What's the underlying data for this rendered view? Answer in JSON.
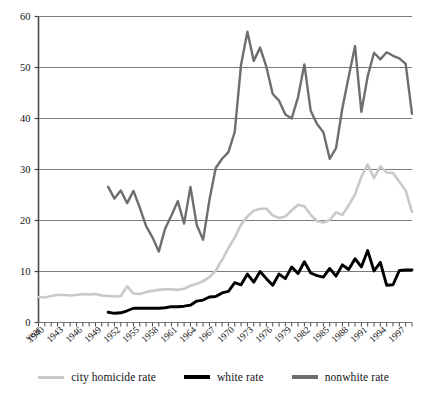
{
  "chart_data": {
    "type": "line",
    "title": "",
    "subtitle": "",
    "xlabel": "year",
    "ylabel": "",
    "ylim": [
      0,
      60
    ],
    "yticks": [
      0,
      10,
      20,
      30,
      40,
      50,
      60
    ],
    "grid": true,
    "legend_position": "bottom",
    "x_axis_first_label": "year",
    "xticks": [
      "1940",
      "1943",
      "1946",
      "1949",
      "1952",
      "1955",
      "1958",
      "1961",
      "1964",
      "1967",
      "1970",
      "1973",
      "1976",
      "1979",
      "1982",
      "1985",
      "1988",
      "1991",
      "1994",
      "1997"
    ],
    "x": [
      1939,
      1940,
      1941,
      1942,
      1943,
      1944,
      1945,
      1946,
      1947,
      1948,
      1949,
      1950,
      1951,
      1952,
      1953,
      1954,
      1955,
      1956,
      1957,
      1958,
      1959,
      1960,
      1961,
      1962,
      1963,
      1964,
      1965,
      1966,
      1967,
      1968,
      1969,
      1970,
      1971,
      1972,
      1973,
      1974,
      1975,
      1976,
      1977,
      1978,
      1979,
      1980,
      1981,
      1982,
      1983,
      1984,
      1985,
      1986,
      1987,
      1988,
      1989,
      1990,
      1991,
      1992,
      1993,
      1994,
      1995,
      1996,
      1997,
      1998
    ],
    "series": [
      {
        "name": "city homicide rate",
        "color": "#c9c9c9",
        "values": [
          5.0,
          4.9,
          5.2,
          5.4,
          5.4,
          5.3,
          5.4,
          5.6,
          5.5,
          5.6,
          5.3,
          5.2,
          5.1,
          5.2,
          7.1,
          5.7,
          5.6,
          6.0,
          6.2,
          6.4,
          6.5,
          6.5,
          6.4,
          6.6,
          7.2,
          7.6,
          8.1,
          8.9,
          10.2,
          12.3,
          14.6,
          16.7,
          19.2,
          20.8,
          21.9,
          22.3,
          22.3,
          21.0,
          20.5,
          20.8,
          22.0,
          23.1,
          22.8,
          21.1,
          19.9,
          19.6,
          20.1,
          21.6,
          21.1,
          23.0,
          25.1,
          28.6,
          31.0,
          28.3,
          30.6,
          29.4,
          29.3,
          27.6,
          25.9,
          21.7
        ]
      },
      {
        "name": "white rate",
        "color": "#000000",
        "values": [
          null,
          null,
          null,
          null,
          null,
          null,
          null,
          null,
          null,
          null,
          null,
          2.0,
          1.8,
          1.9,
          2.3,
          2.8,
          2.8,
          2.8,
          2.8,
          2.8,
          2.9,
          3.1,
          3.1,
          3.2,
          3.4,
          4.2,
          4.4,
          5.0,
          5.1,
          5.8,
          6.1,
          7.8,
          7.4,
          9.5,
          7.9,
          10.0,
          8.6,
          7.3,
          9.5,
          8.6,
          10.9,
          9.6,
          11.9,
          9.7,
          9.2,
          8.9,
          10.6,
          9.1,
          11.3,
          10.4,
          12.5,
          10.9,
          14.1,
          10.1,
          11.8,
          7.3,
          7.4,
          10.2,
          10.3,
          10.3
        ]
      },
      {
        "name": "nonwhite rate",
        "color": "#6e6e6e",
        "values": [
          null,
          null,
          null,
          null,
          null,
          null,
          null,
          null,
          null,
          null,
          null,
          26.6,
          24.3,
          25.9,
          23.4,
          25.8,
          22.5,
          18.9,
          16.7,
          13.9,
          18.4,
          21.0,
          23.8,
          19.4,
          26.6,
          19.1,
          16.2,
          24.0,
          30.3,
          32.1,
          33.4,
          37.4,
          50.6,
          57.0,
          51.3,
          53.9,
          50.1,
          44.8,
          43.5,
          40.8,
          40.0,
          44.2,
          50.6,
          41.5,
          38.9,
          37.3,
          32.1,
          34.2,
          42.0,
          48.2,
          54.2,
          41.3,
          48.3,
          52.9,
          51.6,
          53.0,
          52.3,
          51.8,
          50.7,
          40.9
        ]
      }
    ]
  },
  "legend": {
    "items": [
      {
        "label": "city homicide rate",
        "color": "#c9c9c9",
        "thickness": 3
      },
      {
        "label": "white rate",
        "color": "#000000",
        "thickness": 3.4
      },
      {
        "label": "nonwhite rate",
        "color": "#6e6e6e",
        "thickness": 3.2
      }
    ]
  },
  "axis": {
    "y_labels": [
      "60",
      "50",
      "40",
      "30",
      "20",
      "10",
      "0"
    ],
    "x_labels": [
      "year",
      "1940",
      "1943",
      "1946",
      "1949",
      "1952",
      "1955",
      "1958",
      "1961",
      "1964",
      "1967",
      "1970",
      "1973",
      "1976",
      "1979",
      "1982",
      "1985",
      "1988",
      "1991",
      "1994",
      "1997"
    ]
  },
  "colors": {
    "grid": "#7a7a7a",
    "axis": "#4a4a4a",
    "text": "#141414",
    "background": "#ffffff"
  }
}
